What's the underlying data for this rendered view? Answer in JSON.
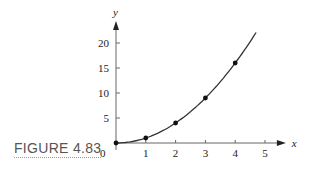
{
  "figure": {
    "caption": "FIGURE 4.83"
  },
  "chart_data": {
    "type": "line",
    "title": "",
    "xlabel": "x",
    "ylabel": "y",
    "x_ticks": [
      1,
      2,
      3,
      4,
      5
    ],
    "y_ticks": [
      5,
      10,
      15,
      20
    ],
    "origin_label": "0",
    "xlim": [
      0,
      5.7
    ],
    "ylim": [
      0,
      22
    ],
    "grid": false,
    "curve": {
      "function": "y = x^2",
      "x_range": [
        0,
        4.7
      ]
    },
    "series": [
      {
        "name": "points",
        "x": [
          0,
          1,
          2,
          3,
          4
        ],
        "y": [
          0,
          1,
          4,
          9,
          16
        ]
      }
    ]
  }
}
